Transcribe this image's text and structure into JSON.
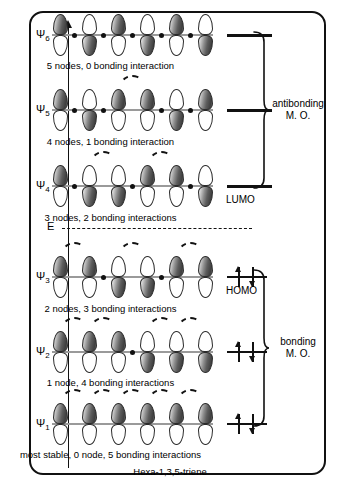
{
  "axis": {
    "label": "E"
  },
  "footer": {
    "molecule": "Hexa-1,3,5-triene"
  },
  "groups": [
    {
      "name": "antibonding",
      "line1": "antibonding",
      "line2": "M. O."
    },
    {
      "name": "bonding",
      "line1": "bonding",
      "line2": "M. O."
    }
  ],
  "tags": {
    "lumo": "LUMO",
    "homo": "HOMO"
  },
  "colors": {
    "dark_lobe": "#4a4a4a",
    "light_lobe": "#ffffff",
    "outline": "#111111",
    "bond_line": "#9a9a9a"
  },
  "chart_data": {
    "type": "diagram",
    "n_atoms": 6,
    "orbitals": [
      {
        "name": "Ψ6",
        "psi": "Ψ",
        "index": "6",
        "caption": "5 nodes, 0 bonding interaction",
        "nodes": 5,
        "bonding_interactions": 0,
        "electrons": 0,
        "occupancy_label": "",
        "phases": [
          "dark",
          "light",
          "dark",
          "light",
          "dark",
          "light"
        ],
        "node_positions": [
          1,
          2,
          3,
          4,
          5
        ],
        "arcs": [],
        "group": "antibonding"
      },
      {
        "name": "Ψ5",
        "psi": "Ψ",
        "index": "5",
        "caption": "4 nodes, 1 bonding interaction",
        "nodes": 4,
        "bonding_interactions": 1,
        "electrons": 0,
        "occupancy_label": "",
        "phases": [
          "dark",
          "light",
          "dark",
          "dark",
          "light",
          "dark"
        ],
        "node_positions": [
          1,
          2,
          4,
          5
        ],
        "arcs": [
          3
        ],
        "group": "antibonding"
      },
      {
        "name": "Ψ4",
        "psi": "Ψ",
        "index": "4",
        "caption": "3 nodes, 2 bonding interactions",
        "nodes": 3,
        "bonding_interactions": 2,
        "electrons": 0,
        "occupancy_label": "LUMO",
        "phases": [
          "dark",
          "light",
          "light",
          "dark",
          "dark",
          "light"
        ],
        "node_positions": [
          1,
          3,
          5
        ],
        "arcs": [
          2,
          4
        ],
        "group": "antibonding"
      },
      {
        "name": "Ψ3",
        "psi": "Ψ",
        "index": "3",
        "caption": "2 nodes, 3 bonding interactions",
        "nodes": 2,
        "bonding_interactions": 3,
        "electrons": 2,
        "occupancy_label": "HOMO",
        "phases": [
          "dark",
          "dark",
          "light",
          "light",
          "dark",
          "dark"
        ],
        "node_positions": [
          2,
          4
        ],
        "arcs": [
          1,
          3,
          5
        ],
        "group": "bonding"
      },
      {
        "name": "Ψ2",
        "psi": "Ψ",
        "index": "2",
        "caption": "1 node, 4 bonding interactions",
        "nodes": 1,
        "bonding_interactions": 4,
        "electrons": 2,
        "occupancy_label": "",
        "phases": [
          "dark",
          "dark",
          "dark",
          "light",
          "light",
          "light"
        ],
        "node_positions": [
          3
        ],
        "arcs": [
          1,
          2,
          4,
          5
        ],
        "group": "bonding"
      },
      {
        "name": "Ψ1",
        "psi": "Ψ",
        "index": "1",
        "caption": "most stable, 0  node, 5 bonding interactions",
        "nodes": 0,
        "bonding_interactions": 5,
        "electrons": 2,
        "occupancy_label": "",
        "phases": [
          "dark",
          "dark",
          "dark",
          "dark",
          "dark",
          "dark"
        ],
        "node_positions": [],
        "arcs": [
          1,
          2,
          3,
          4,
          5
        ],
        "group": "bonding"
      }
    ],
    "separator": "energy zero / nonbonding level (dashed)",
    "axis_label": "E"
  }
}
